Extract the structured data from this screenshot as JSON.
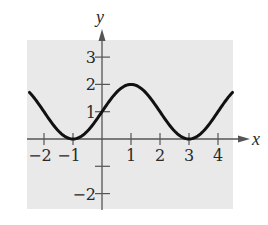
{
  "chart_data": {
    "type": "line",
    "title": "",
    "xlabel": "x",
    "ylabel": "y",
    "xlim": [
      -2.5,
      4.5
    ],
    "ylim": [
      -2.5,
      3.5
    ],
    "grid": false,
    "background": "#e9e9e9",
    "x_ticks": [
      -2,
      -1,
      1,
      2,
      3,
      4
    ],
    "x_tick_labels": [
      "−2",
      "−1",
      "1",
      "2",
      "3",
      "4"
    ],
    "y_ticks": [
      3,
      2,
      1,
      -1,
      -2
    ],
    "y_tick_labels": [
      "3",
      "2",
      "1",
      "",
      "−2"
    ],
    "series": [
      {
        "name": "y = 1 + sin(πx/2)",
        "color": "#111111",
        "x": [
          -2.5,
          -2,
          -1.5,
          -1,
          -0.5,
          0,
          0.5,
          1,
          1.5,
          2,
          2.5,
          3,
          3.5,
          4,
          4.5
        ],
        "values": [
          1.71,
          1.0,
          0.29,
          0.0,
          0.29,
          1.0,
          1.71,
          2.0,
          1.71,
          1.0,
          0.29,
          0.0,
          0.29,
          1.0,
          1.71
        ]
      }
    ],
    "key_points": [
      {
        "x": -1,
        "y": 0,
        "label": "minimum"
      },
      {
        "x": 0,
        "y": 1,
        "label": "y-intercept"
      },
      {
        "x": 1,
        "y": 2,
        "label": "maximum"
      },
      {
        "x": 3,
        "y": 0,
        "label": "minimum"
      }
    ]
  }
}
